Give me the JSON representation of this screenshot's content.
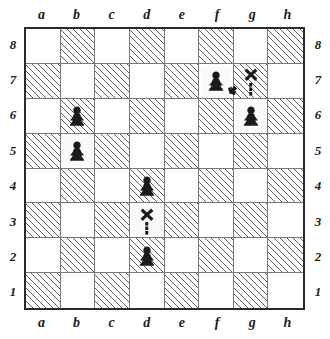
{
  "diagram": {
    "type": "chessboard",
    "orientation": "white-bottom",
    "square_count": 64,
    "files": [
      "a",
      "b",
      "c",
      "d",
      "e",
      "f",
      "g",
      "h"
    ],
    "ranks": [
      "8",
      "7",
      "6",
      "5",
      "4",
      "3",
      "2",
      "1"
    ],
    "colors": {
      "board_border": "#2a2a2a",
      "grid_line": "#777777",
      "dark_square_hatch": "#5d5d5d",
      "light_square": "#ffffff",
      "piece": "#1b1b1b",
      "annotation": "#1b1b1b"
    },
    "pieces": [
      {
        "square": "f7",
        "color": "black",
        "type": "pawn",
        "glyph": "pawn-icon"
      },
      {
        "square": "g6",
        "color": "black",
        "type": "pawn",
        "glyph": "pawn-icon"
      },
      {
        "square": "b6",
        "color": "black",
        "type": "pawn",
        "glyph": "pawn-icon"
      },
      {
        "square": "b5",
        "color": "black",
        "type": "pawn",
        "glyph": "pawn-icon"
      },
      {
        "square": "d4",
        "color": "black",
        "type": "pawn",
        "glyph": "pawn-icon"
      },
      {
        "square": "d2",
        "color": "black",
        "type": "pawn",
        "glyph": "pawn-icon"
      }
    ],
    "annotations": [
      {
        "square": "g7",
        "mark": "x-mark-icon",
        "trail": "dashed-line",
        "from": "g6"
      },
      {
        "square": "d3",
        "mark": "x-mark-icon",
        "trail": "dashed-line",
        "from": "d2"
      },
      {
        "square": "g7",
        "mark": "arrowhead-icon",
        "direction": "up-right",
        "from": "f7"
      }
    ]
  }
}
